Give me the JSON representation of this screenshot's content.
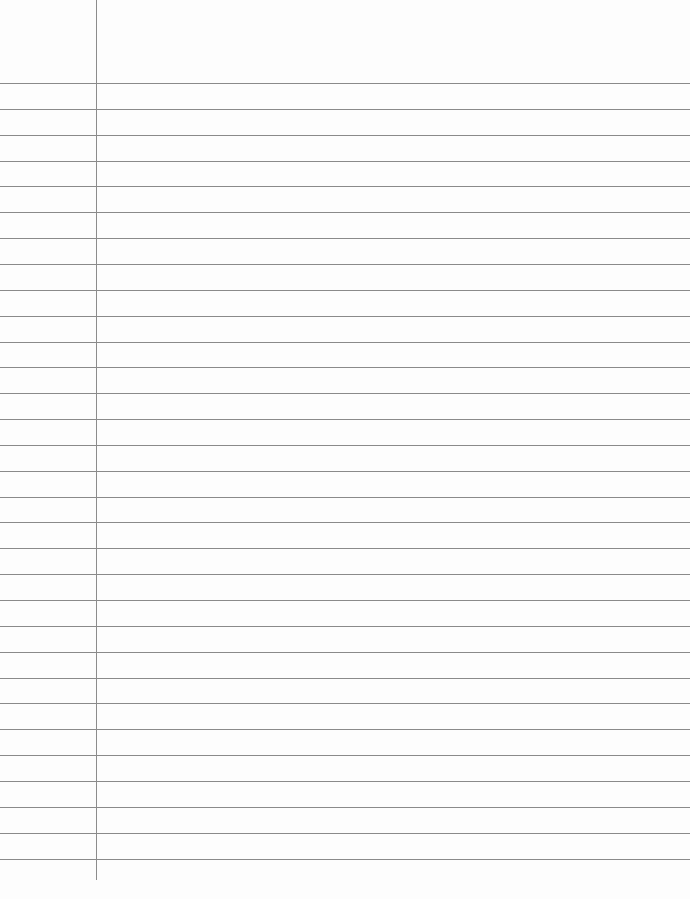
{
  "paper": {
    "type": "lined-paper",
    "ruled_lines": {
      "count": 31,
      "first_y": 83,
      "spacing": 25.85,
      "color": "#8a8a8a"
    },
    "margin_line": {
      "x": 96,
      "color": "#8c8c8c"
    },
    "background": "#fdfdfd",
    "text": []
  }
}
